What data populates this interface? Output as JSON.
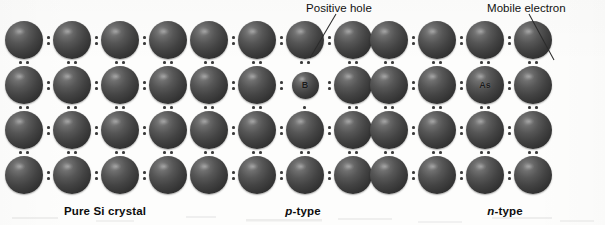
{
  "figure": {
    "background_color": "#fdfdfc",
    "atom_color_dark": "#2a2a2a",
    "atom_color_light": "#8e8e8e",
    "dot_color": "#3a3a3a",
    "text_color": "#111111",
    "width": 605,
    "height": 225
  },
  "panels": [
    {
      "id": "pure-si",
      "caption_prefix": "",
      "caption_main": "Pure Si crystal",
      "caption_center_x": 105,
      "origin_x": 5,
      "dopant": null,
      "annotation": null
    },
    {
      "id": "p-type",
      "caption_prefix": "p",
      "caption_main": "-type",
      "caption_center_x": 303,
      "origin_x": 190,
      "dopant": {
        "symbol": "B",
        "name": "boron",
        "row": 1,
        "col": 2,
        "size": 27
      },
      "annotation": {
        "label": "Positive hole",
        "text_x": 306,
        "text_y": 2,
        "line_x1": 336,
        "line_y1": 14,
        "line_x2": 310,
        "line_y2": 58
      }
    },
    {
      "id": "n-type",
      "caption_prefix": "n",
      "caption_main": "-type",
      "caption_center_x": 505,
      "origin_x": 370,
      "dopant": {
        "symbol": "As",
        "name": "arsenic",
        "row": 1,
        "col": 2,
        "size": 38
      },
      "annotation": {
        "label": "Mobile electron",
        "text_x": 487,
        "text_y": 2,
        "line_x1": 529,
        "line_y1": 14,
        "line_x2": 554,
        "line_y2": 60
      }
    }
  ],
  "lattice": {
    "rows": 4,
    "cols": 4,
    "atom_size": 38,
    "col_pitch": 48,
    "row_pitch": 45,
    "first_row_top": 21,
    "bond_dot_size": 3,
    "description": "4 by 4 grid of silicon atoms joined by paired covalent bonding electron dots"
  }
}
